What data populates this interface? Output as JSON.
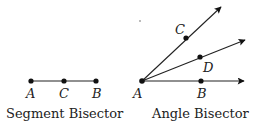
{
  "segment_bisector": {
    "caption": "Segment Bisector",
    "points": [
      {
        "label": "A",
        "x": 31,
        "y": 81
      },
      {
        "label": "C",
        "x": 64,
        "y": 81
      },
      {
        "label": "B",
        "x": 96,
        "y": 81
      }
    ]
  },
  "angle_bisector": {
    "caption": "Angle Bisector",
    "vertex": {
      "label": "A",
      "x": 142,
      "y": 81
    },
    "rays": [
      {
        "point_label": "C",
        "point": [
          186,
          38
        ],
        "tip": [
          222,
          6
        ]
      },
      {
        "point_label": "D",
        "point": [
          200,
          57
        ],
        "tip": [
          246,
          40
        ]
      },
      {
        "point_label": "B",
        "point": [
          201,
          81
        ],
        "tip": [
          245,
          81
        ]
      }
    ]
  }
}
